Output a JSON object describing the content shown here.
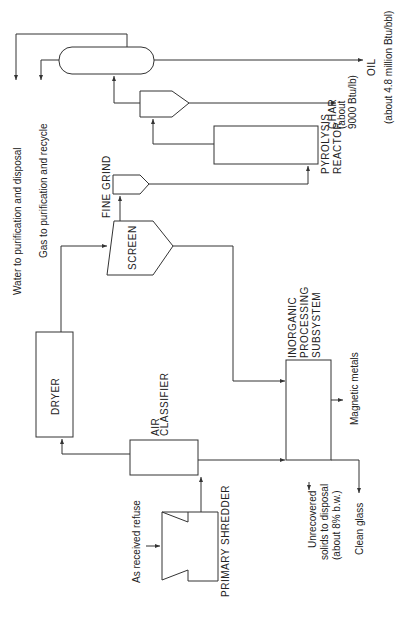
{
  "diagram": {
    "type": "process-flow",
    "orientation": "rotated-90-ccw",
    "units": [
      {
        "id": "primary-shredder",
        "label": "PRIMARY SHREDDER"
      },
      {
        "id": "air-classifier",
        "label_lines": [
          "AIR",
          "CLASSIFIER"
        ]
      },
      {
        "id": "dryer",
        "label": "DRYER"
      },
      {
        "id": "screen",
        "label": "SCREEN"
      },
      {
        "id": "fine-grind",
        "label": "FINE GRIND"
      },
      {
        "id": "pyrolysis-reactor",
        "label_lines": [
          "PYROLYSIS",
          "REACTOR"
        ]
      },
      {
        "id": "char-separator",
        "label": ""
      },
      {
        "id": "oil-separator",
        "label": ""
      },
      {
        "id": "inorganic-processing",
        "label_lines": [
          "INORGANIC",
          "PROCESSING",
          "SUBSYSTEM"
        ]
      }
    ],
    "streams": {
      "feed": "As received refuse",
      "water": "Water to purification and disposal",
      "gas": "Gas to purification and recycle",
      "char_lines": [
        "CHAR",
        "(about",
        "9000 Btu/lb)"
      ],
      "oil_lines": [
        "OIL",
        "(about 4.8 million Btu/bbl)"
      ],
      "magnetic": "Magnetic metals",
      "glass": "Clean glass",
      "unrecovered_lines": [
        "Unrecovered",
        "solids to disposal",
        "(about 8% b.w.)"
      ]
    },
    "edges": [
      [
        "feed",
        "primary-shredder"
      ],
      [
        "primary-shredder",
        "air-classifier"
      ],
      [
        "air-classifier",
        "dryer"
      ],
      [
        "air-classifier",
        "inorganic-processing"
      ],
      [
        "dryer",
        "screen"
      ],
      [
        "screen",
        "fine-grind"
      ],
      [
        "screen",
        "inorganic-processing"
      ],
      [
        "fine-grind",
        "pyrolysis-reactor"
      ],
      [
        "pyrolysis-reactor",
        "char-separator"
      ],
      [
        "char-separator",
        "char"
      ],
      [
        "char-separator",
        "oil-separator"
      ],
      [
        "oil-separator",
        "oil"
      ],
      [
        "oil-separator",
        "water"
      ],
      [
        "oil-separator",
        "gas"
      ],
      [
        "inorganic-processing",
        "magnetic"
      ],
      [
        "inorganic-processing",
        "glass"
      ],
      [
        "inorganic-processing",
        "unrecovered"
      ]
    ]
  }
}
